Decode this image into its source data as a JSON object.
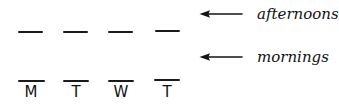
{
  "canvas": {
    "width": 339,
    "height": 105,
    "background": "#ffffff",
    "ink": "#1a1a1a"
  },
  "chart_data": {
    "type": "table",
    "title": "",
    "subtitle": "",
    "xlabel": "",
    "ylabel": "",
    "categories": [
      "M",
      "T",
      "W",
      "T"
    ],
    "series": [
      {
        "name": "afternoons",
        "values": [
          "—",
          "—",
          "—",
          "—"
        ]
      },
      {
        "name": "mornings",
        "values": [
          "—",
          "—",
          "—",
          "—"
        ]
      }
    ],
    "grid": false,
    "legend_position": "right"
  },
  "rows": {
    "afternoons": {
      "marks": [
        {
          "x": 18,
          "y": 31,
          "width": 25
        },
        {
          "x": 63,
          "y": 31,
          "width": 25
        },
        {
          "x": 108,
          "y": 31,
          "width": 25
        },
        {
          "x": 155,
          "y": 30,
          "width": 25
        }
      ]
    },
    "mornings": {
      "marks": [
        {
          "x": 18,
          "y": 80,
          "width": 27
        },
        {
          "x": 63,
          "y": 80,
          "width": 26
        },
        {
          "x": 108,
          "y": 80,
          "width": 26
        },
        {
          "x": 154,
          "y": 79,
          "width": 26
        }
      ]
    }
  },
  "days": [
    {
      "label": "M",
      "x": 18,
      "y": 85,
      "width": 26
    },
    {
      "label": "T",
      "x": 63,
      "y": 85,
      "width": 26
    },
    {
      "label": "W",
      "x": 108,
      "y": 85,
      "width": 26
    },
    {
      "label": "T",
      "x": 154,
      "y": 85,
      "width": 26
    }
  ],
  "annotations": [
    {
      "id": "afternoons",
      "label": "afternoons",
      "arrow_direction": "left",
      "x": 199,
      "y": 6,
      "arrow_length": 40
    },
    {
      "id": "mornings",
      "label": "mornings",
      "arrow_direction": "left",
      "x": 199,
      "y": 49,
      "arrow_length": 40
    }
  ]
}
